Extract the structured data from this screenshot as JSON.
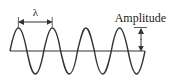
{
  "diagram": {
    "type": "sine-wave",
    "labels": {
      "wavelength": "λ",
      "amplitude": "Amplitude"
    },
    "colors": {
      "stroke": "#333333",
      "text": "#222222",
      "background": "#ffffff"
    },
    "wave": {
      "cycles": 4,
      "start_x": 10,
      "end_x": 145,
      "baseline_y": 51,
      "amplitude_px": 23
    }
  }
}
